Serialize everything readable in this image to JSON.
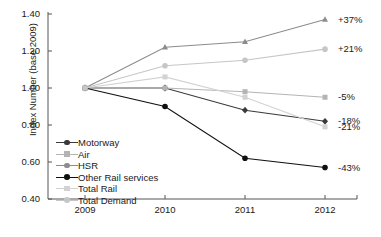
{
  "chart_data": {
    "type": "line",
    "title": "",
    "xlabel": "",
    "ylabel": "Index Number (base 2009)",
    "x": [
      "2009",
      "2010",
      "2011",
      "2012"
    ],
    "categories": [
      "2009",
      "2010",
      "2011",
      "2012"
    ],
    "ylim": [
      0.4,
      1.4
    ],
    "yticks": [
      "0.40",
      "0.60",
      "0.80",
      "1.00",
      "1.20",
      "1.40"
    ],
    "ytick_values": [
      0.4,
      0.6,
      0.8,
      1.0,
      1.2,
      1.4
    ],
    "grid": false,
    "legend_position": "inside-lower-left",
    "series": [
      {
        "name": "Motorway",
        "values": [
          1.0,
          1.0,
          0.88,
          0.82
        ],
        "end_label": "-18%",
        "color": "#3a3a3a",
        "marker": "diamond"
      },
      {
        "name": "Air",
        "values": [
          1.0,
          1.0,
          0.98,
          0.95
        ],
        "end_label": "-5%",
        "color": "#b4b4b4",
        "marker": "square"
      },
      {
        "name": "HSR",
        "values": [
          1.0,
          1.22,
          1.25,
          1.37
        ],
        "end_label": "+37%",
        "color": "#8c8c8c",
        "marker": "triangle"
      },
      {
        "name": "Other Rail services",
        "values": [
          1.0,
          0.9,
          0.62,
          0.57
        ],
        "end_label": "-43%",
        "color": "#101010",
        "marker": "circle"
      },
      {
        "name": "Total Rail",
        "values": [
          1.0,
          1.06,
          0.95,
          0.79
        ],
        "end_label": "-21%",
        "color": "#d2d2d2",
        "marker": "square"
      },
      {
        "name": "Total Demand",
        "values": [
          1.0,
          1.12,
          1.15,
          1.21
        ],
        "end_label": "+21%",
        "color": "#c6c6c6",
        "marker": "circle"
      }
    ],
    "annotations": [
      "+37%",
      "+21%",
      "-5%",
      "-18%",
      "-21%",
      "-43%"
    ]
  },
  "legend": {
    "items": [
      {
        "label": "Motorway"
      },
      {
        "label": "Air"
      },
      {
        "label": "HSR"
      },
      {
        "label": "Other Rail services"
      },
      {
        "label": "Total Rail"
      },
      {
        "label": "Total Demand"
      }
    ]
  },
  "caption": {
    "text": ""
  }
}
